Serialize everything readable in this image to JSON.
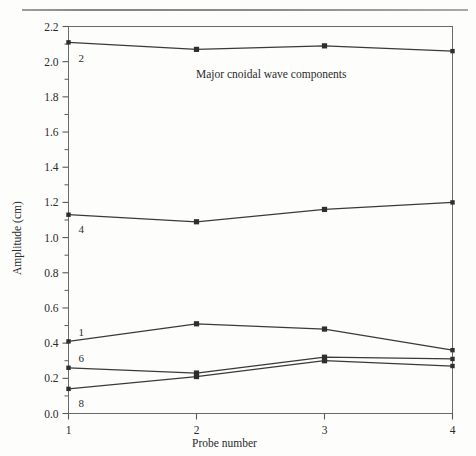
{
  "page": {
    "background_color": "#fdfdfc",
    "rule_color": "#7a7a7a"
  },
  "chart_data": {
    "type": "line",
    "title": "Major cnoidal wave components",
    "xlabel": "Probe number",
    "ylabel": "Amplitude (cm)",
    "x": [
      1,
      2,
      3,
      4
    ],
    "categories": [
      "1",
      "2",
      "3",
      "4"
    ],
    "xlim": [
      1,
      4
    ],
    "ylim": [
      0.0,
      2.2
    ],
    "y_major_ticks": [
      "0.0",
      "0.2",
      "0.4",
      "0.6",
      "0.8",
      "1.0",
      "1.2",
      "1.4",
      "1.6",
      "1.8",
      "2.0",
      "2.2"
    ],
    "y_minor_tick_step": 0.1,
    "grid": false,
    "legend": "inline-labels-left",
    "line_color": "#3a3a3a",
    "marker_color": "#2e2e2e",
    "series": [
      {
        "name": "2",
        "label": "2",
        "values": [
          2.11,
          2.07,
          2.09,
          2.06
        ]
      },
      {
        "name": "4",
        "label": "4",
        "values": [
          1.13,
          1.09,
          1.16,
          1.2
        ]
      },
      {
        "name": "1",
        "label": "1",
        "values": [
          0.41,
          0.51,
          0.48,
          0.36
        ]
      },
      {
        "name": "6",
        "label": "6",
        "values": [
          0.26,
          0.23,
          0.32,
          0.31
        ]
      },
      {
        "name": "8",
        "label": "8",
        "values": [
          0.14,
          0.21,
          0.3,
          0.27
        ]
      }
    ]
  }
}
